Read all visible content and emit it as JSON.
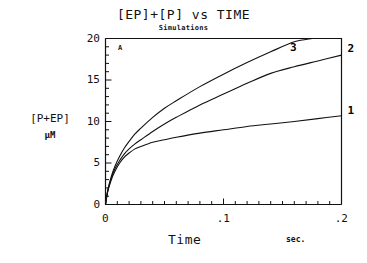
{
  "chart_data": {
    "type": "line",
    "title": "[EP]+[P] vs TIME",
    "subtitle": "Simulations",
    "panel_label": "A",
    "xlabel": "Time",
    "xunits": "sec.",
    "ylabel": "[P+EP]",
    "yunits": "µM",
    "xlim": [
      0,
      0.2
    ],
    "ylim": [
      0,
      20
    ],
    "xticks": [
      0,
      0.1,
      0.2
    ],
    "xtick_labels": [
      "0",
      ".1",
      ".2"
    ],
    "yticks": [
      0,
      5,
      10,
      15,
      20
    ],
    "ytick_labels": [
      "0",
      "5",
      "10",
      "15",
      "20"
    ],
    "x_minor_tick_count": 20,
    "y_minor_tick_count": 20,
    "grid": false,
    "legend": "inline-curve-labels",
    "series": [
      {
        "name": "1",
        "label": "1",
        "x": [
          0,
          0.002,
          0.005,
          0.008,
          0.012,
          0.016,
          0.02,
          0.025,
          0.03,
          0.04,
          0.05,
          0.06,
          0.08,
          0.1,
          0.12,
          0.14,
          0.16,
          0.18,
          0.2
        ],
        "values": [
          0,
          1.6,
          3.0,
          4.0,
          5.0,
          5.7,
          6.2,
          6.7,
          7.0,
          7.5,
          7.8,
          8.1,
          8.6,
          9.0,
          9.4,
          9.7,
          10.0,
          10.35,
          10.7
        ]
      },
      {
        "name": "2",
        "label": "2",
        "x": [
          0,
          0.002,
          0.005,
          0.008,
          0.012,
          0.016,
          0.02,
          0.025,
          0.03,
          0.04,
          0.05,
          0.06,
          0.08,
          0.1,
          0.12,
          0.14,
          0.16,
          0.18,
          0.2
        ],
        "values": [
          0,
          1.7,
          3.2,
          4.3,
          5.3,
          6.1,
          6.7,
          7.3,
          7.8,
          8.8,
          9.7,
          10.5,
          12.0,
          13.3,
          14.6,
          15.8,
          16.6,
          17.3,
          18.0
        ]
      },
      {
        "name": "3",
        "label": "3",
        "x": [
          0,
          0.002,
          0.005,
          0.008,
          0.012,
          0.016,
          0.02,
          0.025,
          0.03,
          0.04,
          0.05,
          0.06,
          0.08,
          0.1,
          0.12,
          0.14,
          0.16,
          0.175
        ],
        "values": [
          0,
          1.8,
          3.4,
          4.6,
          5.8,
          6.8,
          7.6,
          8.5,
          9.2,
          10.5,
          11.6,
          12.5,
          14.2,
          15.7,
          17.1,
          18.4,
          19.6,
          20.0
        ]
      }
    ]
  }
}
